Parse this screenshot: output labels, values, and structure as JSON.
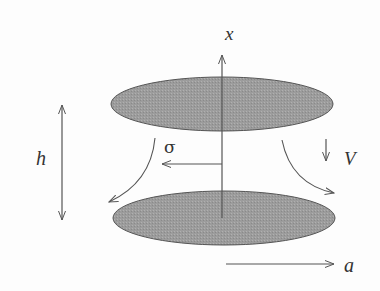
{
  "diagram": {
    "colors": {
      "disk_fill": "#9a9a9a",
      "disk_stroke": "#555555",
      "line": "#555555",
      "text": "#333333",
      "background": "#fdfdfd"
    },
    "labels": {
      "axis_x": "x",
      "gap_height": "h",
      "stress": "σ",
      "velocity": "V",
      "radius": "a"
    },
    "elements": {
      "top_disk": {
        "cx": 222,
        "cy": 104,
        "rx": 111,
        "ry": 27
      },
      "bottom_disk": {
        "cx": 224,
        "cy": 218,
        "rx": 111,
        "ry": 27
      }
    }
  }
}
